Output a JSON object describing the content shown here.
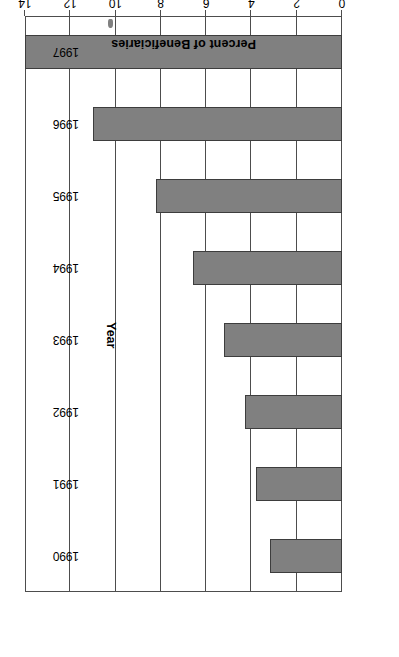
{
  "chart_data": {
    "type": "bar",
    "orientation": "horizontal",
    "title": "",
    "xlabel": "Percent of Beneficiaries",
    "ylabel": "Year",
    "categories": [
      "1990",
      "1991",
      "1992",
      "1993",
      "1994",
      "1995",
      "1996",
      "1997"
    ],
    "values": [
      3.2,
      3.8,
      4.3,
      5.2,
      6.6,
      8.2,
      11.0,
      14.0
    ],
    "xlim": [
      0,
      14
    ],
    "xticks": [
      0,
      2,
      4,
      6,
      8,
      10,
      12,
      14
    ],
    "xtick_labels": [
      "0",
      "2",
      "4",
      "6",
      "8",
      "10",
      "12",
      "14"
    ],
    "grid": true,
    "grid_axis": "x",
    "legend": null,
    "bar_color": "#808080",
    "bar_edge_color": "#3d3d3d",
    "axis_color": "#4d4d4d",
    "page_rotation_degrees": 180
  },
  "figure": {
    "x_axis_title": "Percent of Beneficiaries",
    "y_axis_title": "Year",
    "artifact_name": "scan-smudge"
  }
}
